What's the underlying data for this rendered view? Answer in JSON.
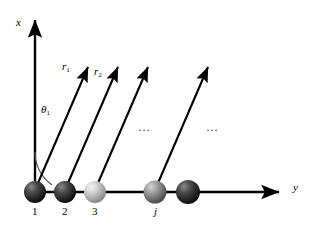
{
  "figure": {
    "background_color": "#ffffff",
    "line_color": "#000000",
    "width": 315,
    "height": 236
  },
  "axes": {
    "vertical": {
      "label": "x",
      "name": "x-axis",
      "x": 35,
      "y_start": 192,
      "y_end": 16,
      "label_x": 16,
      "label_y": 22
    },
    "horizontal": {
      "label": "y",
      "name": "y-axis",
      "x_start": 35,
      "x_end": 283,
      "y": 192,
      "label_x": 293,
      "label_y": 186
    }
  },
  "angle": {
    "label": "θ",
    "subscript": "1",
    "label_x": 42,
    "label_y": 108,
    "arc_radius": 40,
    "color": "#555555"
  },
  "vectors": [
    {
      "name": "vector-r1",
      "label": "r",
      "subscript": "1",
      "x1": 35,
      "y1": 190,
      "x2": 92,
      "y2": 58,
      "label_x": 63,
      "label_y": 66
    },
    {
      "name": "vector-r2",
      "label": "r",
      "subscript": "2",
      "x1": 65,
      "y1": 190,
      "x2": 122,
      "y2": 58,
      "label_x": 95,
      "label_y": 70
    },
    {
      "name": "vector-r3",
      "label": "",
      "subscript": "",
      "x1": 95,
      "y1": 190,
      "x2": 152,
      "y2": 58,
      "label_x": 0,
      "label_y": 0
    },
    {
      "name": "vector-rj",
      "label": "",
      "subscript": "",
      "x1": 155,
      "y1": 190,
      "x2": 212,
      "y2": 58,
      "label_x": 0,
      "label_y": 0
    }
  ],
  "spheres": [
    {
      "name": "sphere-1",
      "label": "1",
      "italic": false,
      "cx": 35,
      "cy": 192,
      "r": 11,
      "tone": "dark",
      "label_x": 32,
      "label_y": 208
    },
    {
      "name": "sphere-2",
      "label": "2",
      "italic": false,
      "cx": 65,
      "cy": 192,
      "r": 11,
      "tone": "dark",
      "label_x": 62,
      "label_y": 208
    },
    {
      "name": "sphere-3",
      "label": "3",
      "italic": false,
      "cx": 95,
      "cy": 192,
      "r": 11,
      "tone": "light",
      "label_x": 92,
      "label_y": 208
    },
    {
      "name": "sphere-j",
      "label": "j",
      "italic": true,
      "cx": 155,
      "cy": 192,
      "r": 11,
      "tone": "mid",
      "label_x": 153,
      "label_y": 208
    },
    {
      "name": "sphere-last",
      "label": "",
      "italic": false,
      "cx": 188,
      "cy": 192,
      "r": 12,
      "tone": "dark",
      "label_x": 0,
      "label_y": 0
    }
  ],
  "ellipses": [
    {
      "name": "ellipsis-left",
      "text": "…",
      "x": 140,
      "y": 128
    },
    {
      "name": "ellipsis-right",
      "text": "…",
      "x": 208,
      "y": 128
    }
  ],
  "colors": {
    "stroke": "#000000",
    "sphere_dark_highlight": "#8a8a8a",
    "sphere_dark_mid": "#3d3d3d",
    "sphere_dark_edge": "#141414",
    "sphere_light_highlight": "#f2f2f2",
    "sphere_light_mid": "#c9c9c9",
    "sphere_light_edge": "#8e8e8e",
    "sphere_mid_highlight": "#cfcfcf",
    "sphere_mid_mid": "#8f8f8f",
    "sphere_mid_edge": "#555555",
    "arc": "#555555"
  }
}
